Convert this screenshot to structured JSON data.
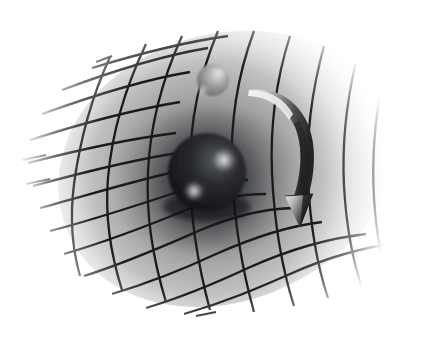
{
  "figure": {
    "title": "Spacetime curvature caused by a massive body",
    "medium": "grayscale airbrush illustration",
    "canvas": {
      "width": 423,
      "height": 339,
      "background": "#ffffff"
    }
  },
  "palette": {
    "background": "#ffffff",
    "grid_line": "#1a1a1a",
    "sheet_far": "#ffffff",
    "sheet_mid": "#b4b4b4",
    "sheet_near_well": "#6e6e6e",
    "well_shadow": "#4a4a4a",
    "large_mass_dark": "#17181a",
    "large_mass_mid": "#3a3c40",
    "large_mass_highlight": "#c9c9c9",
    "small_mass_base": "#8e8e8e",
    "small_mass_highlight": "#e2e2e2",
    "arrow_light": "#e8e8e8",
    "arrow_mid": "#9a9a9a",
    "arrow_dark": "#2a2a2a",
    "arrowhead_dark": "#1f1f1f"
  },
  "elements": {
    "sheet": {
      "name": "spacetime-grid-sheet",
      "description": "Deformed rubber-sheet grid of crossing lines, dipping into a funnel at center-left",
      "grid_rows": 11,
      "grid_columns": 11,
      "line_width_px": 2.2,
      "line_color": "#1a1a1a",
      "edge_fade": "lines terminate and fade toward white at the outer boundary"
    },
    "well": {
      "name": "gravity-well",
      "center_x": 207,
      "center_y": 178,
      "mouth_radius_x": 112,
      "mouth_radius_y": 74,
      "depth_px": 62,
      "shading": "radial gradient darkening toward the throat"
    },
    "large_mass": {
      "name": "large-mass-sphere",
      "center_x": 207,
      "center_y": 172,
      "radius": 39,
      "fill": "#17181a",
      "highlights": [
        {
          "x": 224,
          "y": 160,
          "r": 11,
          "color": "#c9c9c9"
        },
        {
          "x": 194,
          "y": 191,
          "r": 9,
          "color": "#bdbdbd"
        }
      ]
    },
    "small_mass": {
      "name": "small-mass-sphere",
      "center_x": 213,
      "center_y": 80,
      "radius": 16,
      "fill": "#8e8e8e",
      "highlights": [
        {
          "x": 220,
          "y": 73,
          "r": 6,
          "color": "#e6e6e6"
        },
        {
          "x": 204,
          "y": 90,
          "r": 5,
          "color": "#d8d8d8"
        }
      ]
    },
    "arrow": {
      "name": "curved-direction-arrow",
      "description": "Thick 3D curved ribbon sweeping from upper-left down to a conical arrowhead at lower-right",
      "tail_x": 250,
      "tail_y": 90,
      "tip_x": 302,
      "tip_y": 222,
      "head_width": 28,
      "head_height": 30,
      "shading": "light on the left flank, dark on the right flank"
    }
  },
  "annotations": {
    "visible_text": [],
    "note": "The illustration contains no rendered text labels."
  }
}
